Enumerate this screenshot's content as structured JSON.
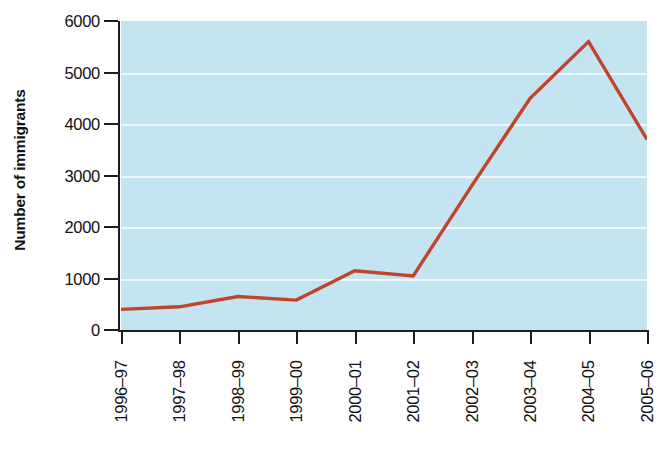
{
  "chart_data": {
    "type": "line",
    "title": "",
    "subtitle": "",
    "xlabel": "",
    "ylabel": "Number of immigrants",
    "categories": [
      "1996–97",
      "1997–98",
      "1998–99",
      "1999–00",
      "2000–01",
      "2001–02",
      "2002–03",
      "2003–04",
      "2004–05",
      "2005–06"
    ],
    "values": [
      400,
      450,
      650,
      580,
      1150,
      1050,
      2800,
      4500,
      5600,
      3700
    ],
    "series": [
      {
        "name": "Number of immigrants",
        "values": [
          400,
          450,
          650,
          580,
          1150,
          1050,
          2800,
          4500,
          5600,
          3700
        ],
        "color": "#c0442c"
      }
    ],
    "ylim": [
      0,
      6000
    ],
    "y_ticks": [
      0,
      1000,
      2000,
      3000,
      4000,
      5000,
      6000
    ],
    "y_tick_labels": [
      "0",
      "1000",
      "2000",
      "3000",
      "4000",
      "5000",
      "6000"
    ],
    "grid": true,
    "grid_axis": "y",
    "legend": false,
    "legend_position": "none",
    "plot_background_color": "#c4e4f2",
    "gridline_color": "#f2fbff",
    "axis_color": "#1d1d22",
    "line_color": "#c0442c",
    "line_width": 3.4,
    "figure_background_color": "#ffffff"
  }
}
